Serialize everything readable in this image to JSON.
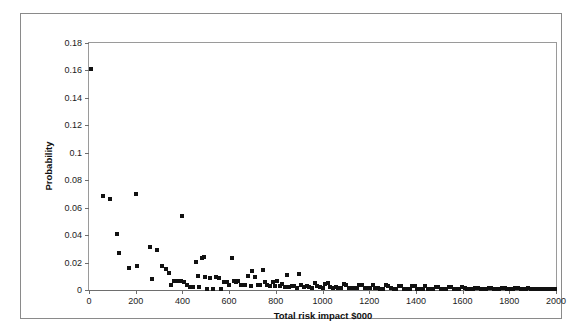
{
  "chart_data": {
    "type": "scatter",
    "title": "",
    "xlabel": "Total risk impact $000",
    "ylabel": "Probability",
    "xlim": [
      0,
      2000
    ],
    "ylim": [
      0,
      0.18
    ],
    "xticks": [
      0,
      200,
      400,
      600,
      800,
      1000,
      1200,
      1400,
      1600,
      1800,
      2000
    ],
    "xtick_labels": [
      "0",
      "200",
      "400",
      "600",
      "800",
      "1000",
      "1200",
      "1400",
      "1600",
      "1800",
      "2000"
    ],
    "yticks": [
      0,
      0.02,
      0.04,
      0.06,
      0.08,
      0.1,
      0.12,
      0.14,
      0.16,
      0.18
    ],
    "ytick_labels": [
      "0",
      "0.02",
      "0.04",
      "0.06",
      "0.08",
      "0.1",
      "0.12",
      "0.14",
      "0.16",
      "0.18"
    ],
    "grid": false,
    "legend": false,
    "marker": "square",
    "marker_color": "#111111",
    "series": [
      {
        "name": "Risk events",
        "points": [
          [
            10,
            0.1612
          ],
          [
            58,
            0.0685
          ],
          [
            88,
            0.0665
          ],
          [
            120,
            0.0405
          ],
          [
            128,
            0.0268
          ],
          [
            172,
            0.0158
          ],
          [
            200,
            0.0697
          ],
          [
            206,
            0.0172
          ],
          [
            262,
            0.0312
          ],
          [
            268,
            0.0082
          ],
          [
            290,
            0.0288
          ],
          [
            312,
            0.0176
          ],
          [
            330,
            0.0152
          ],
          [
            342,
            0.0124
          ],
          [
            352,
            0.0036
          ],
          [
            362,
            0.0068
          ],
          [
            372,
            0.0068
          ],
          [
            382,
            0.0064
          ],
          [
            392,
            0.0062
          ],
          [
            400,
            0.0538
          ],
          [
            406,
            0.0056
          ],
          [
            420,
            0.0038
          ],
          [
            432,
            0.0024
          ],
          [
            444,
            0.0024
          ],
          [
            460,
            0.0206
          ],
          [
            466,
            0.0104
          ],
          [
            472,
            0.0022
          ],
          [
            486,
            0.0232
          ],
          [
            494,
            0.024
          ],
          [
            498,
            0.0092
          ],
          [
            506,
            0.0006
          ],
          [
            520,
            0.0088
          ],
          [
            532,
            0.0006
          ],
          [
            546,
            0.0092
          ],
          [
            558,
            0.0088
          ],
          [
            566,
            0.0004
          ],
          [
            578,
            0.0058
          ],
          [
            590,
            0.0058
          ],
          [
            600,
            0.0036
          ],
          [
            612,
            0.0232
          ],
          [
            620,
            0.0062
          ],
          [
            630,
            0.0058
          ],
          [
            640,
            0.0068
          ],
          [
            652,
            0.0036
          ],
          [
            666,
            0.0034
          ],
          [
            680,
            0.0104
          ],
          [
            692,
            0.003
          ],
          [
            700,
            0.0136
          ],
          [
            712,
            0.0092
          ],
          [
            722,
            0.0038
          ],
          [
            734,
            0.0038
          ],
          [
            744,
            0.0148
          ],
          [
            752,
            0.006
          ],
          [
            762,
            0.0036
          ],
          [
            774,
            0.003
          ],
          [
            786,
            0.0058
          ],
          [
            796,
            0.0028
          ],
          [
            806,
            0.0062
          ],
          [
            818,
            0.0026
          ],
          [
            826,
            0.0044
          ],
          [
            838,
            0.0024
          ],
          [
            848,
            0.0112
          ],
          [
            858,
            0.0024
          ],
          [
            868,
            0.003
          ],
          [
            880,
            0.0026
          ],
          [
            892,
            0.0018
          ],
          [
            900,
            0.012
          ],
          [
            910,
            0.0038
          ],
          [
            922,
            0.0022
          ],
          [
            932,
            0.0026
          ],
          [
            944,
            0.002
          ],
          [
            956,
            0.0018
          ],
          [
            968,
            0.0048
          ],
          [
            978,
            0.0026
          ],
          [
            988,
            0.0022
          ],
          [
            1000,
            0.0018
          ],
          [
            1012,
            0.0046
          ],
          [
            1024,
            0.005
          ],
          [
            1034,
            0.002
          ],
          [
            1046,
            0.0018
          ],
          [
            1058,
            0.0024
          ],
          [
            1068,
            0.0014
          ],
          [
            1080,
            0.0016
          ],
          [
            1092,
            0.0042
          ],
          [
            1102,
            0.004
          ],
          [
            1114,
            0.0016
          ],
          [
            1126,
            0.0016
          ],
          [
            1136,
            0.0012
          ],
          [
            1148,
            0.0014
          ],
          [
            1158,
            0.004
          ],
          [
            1170,
            0.0038
          ],
          [
            1180,
            0.0014
          ],
          [
            1192,
            0.0012
          ],
          [
            1204,
            0.0012
          ],
          [
            1216,
            0.0036
          ],
          [
            1226,
            0.0014
          ],
          [
            1238,
            0.0012
          ],
          [
            1248,
            0.001
          ],
          [
            1260,
            0.001
          ],
          [
            1272,
            0.0034
          ],
          [
            1282,
            0.0032
          ],
          [
            1294,
            0.0012
          ],
          [
            1306,
            0.001
          ],
          [
            1316,
            0.001
          ],
          [
            1328,
            0.003
          ],
          [
            1338,
            0.0028
          ],
          [
            1350,
            0.001
          ],
          [
            1362,
            0.0008
          ],
          [
            1374,
            0.001
          ],
          [
            1384,
            0.0028
          ],
          [
            1396,
            0.0026
          ],
          [
            1406,
            0.0008
          ],
          [
            1418,
            0.0008
          ],
          [
            1430,
            0.0008
          ],
          [
            1440,
            0.0026
          ],
          [
            1452,
            0.0008
          ],
          [
            1462,
            0.0008
          ],
          [
            1474,
            0.0006
          ],
          [
            1486,
            0.0024
          ],
          [
            1496,
            0.0022
          ],
          [
            1508,
            0.0008
          ],
          [
            1518,
            0.0006
          ],
          [
            1530,
            0.0006
          ],
          [
            1542,
            0.0022
          ],
          [
            1552,
            0.002
          ],
          [
            1564,
            0.0006
          ],
          [
            1576,
            0.0006
          ],
          [
            1586,
            0.0006
          ],
          [
            1598,
            0.002
          ],
          [
            1610,
            0.0018
          ],
          [
            1620,
            0.0006
          ],
          [
            1632,
            0.0006
          ],
          [
            1644,
            0.0004
          ],
          [
            1654,
            0.0018
          ],
          [
            1666,
            0.0016
          ],
          [
            1678,
            0.0006
          ],
          [
            1688,
            0.0004
          ],
          [
            1700,
            0.0004
          ],
          [
            1712,
            0.0016
          ],
          [
            1722,
            0.0014
          ],
          [
            1734,
            0.0004
          ],
          [
            1746,
            0.0004
          ],
          [
            1756,
            0.0004
          ],
          [
            1768,
            0.0014
          ],
          [
            1780,
            0.0012
          ],
          [
            1790,
            0.0004
          ],
          [
            1802,
            0.0004
          ],
          [
            1814,
            0.0004
          ],
          [
            1824,
            0.0012
          ],
          [
            1836,
            0.0012
          ],
          [
            1848,
            0.0004
          ],
          [
            1858,
            0.0004
          ],
          [
            1870,
            0.0004
          ],
          [
            1882,
            0.0012
          ],
          [
            1892,
            0.001
          ],
          [
            1904,
            0.0004
          ],
          [
            1916,
            0.0004
          ],
          [
            1926,
            0.0004
          ],
          [
            1938,
            0.001
          ],
          [
            1950,
            0.001
          ],
          [
            1960,
            0.0004
          ],
          [
            1972,
            0.0004
          ],
          [
            1984,
            0.0004
          ],
          [
            1994,
            0.0004
          ]
        ]
      }
    ]
  }
}
